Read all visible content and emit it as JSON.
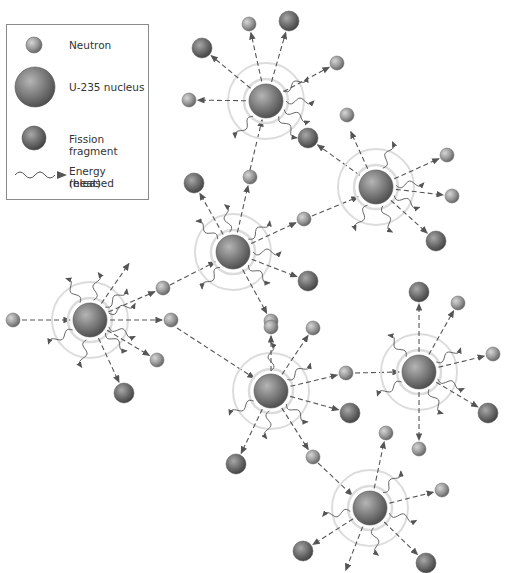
{
  "legend": {
    "items": [
      {
        "key": "neutron",
        "label": "Neutron",
        "icon": "small-light-sphere"
      },
      {
        "key": "u235",
        "label": "U-235 nucleus",
        "icon": "large-sphere"
      },
      {
        "key": "fragment",
        "label": "Fission fragment",
        "icon": "medium-dark-sphere"
      },
      {
        "key": "energy",
        "label": "Energy released",
        "label2": "(heat)",
        "icon": "wavy-arrow"
      }
    ]
  },
  "colors": {
    "neutron": "#9a9a9a",
    "nucleus": "#7a7a7a",
    "fragment": "#6c6c6c",
    "halo": "#d8d8d8",
    "arrow": "#555555",
    "legend_border": "#8a8a8a"
  },
  "diagram": {
    "type": "nuclear-chain-reaction",
    "fissions": [
      {
        "id": "f1",
        "x": 90,
        "y": 320
      },
      {
        "id": "f2",
        "x": 233,
        "y": 252
      },
      {
        "id": "f3",
        "x": 266,
        "y": 101
      },
      {
        "id": "f4",
        "x": 376,
        "y": 187
      },
      {
        "id": "f5",
        "x": 271,
        "y": 391
      },
      {
        "id": "f6",
        "x": 419,
        "y": 372
      },
      {
        "id": "f7",
        "x": 370,
        "y": 508
      }
    ]
  }
}
